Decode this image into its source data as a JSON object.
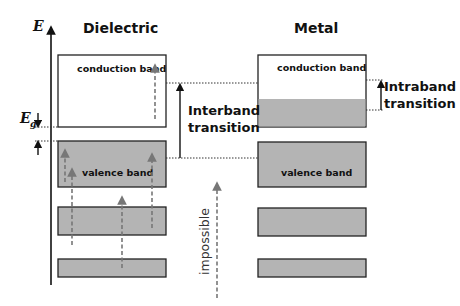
{
  "axis": {
    "label": "E",
    "gap_label": "E",
    "gap_subscript": "g"
  },
  "dielectric": {
    "title": "Dielectric",
    "conduction_band": "conduction band",
    "valence_band": "valence band"
  },
  "metal": {
    "title": "Metal",
    "conduction_band": "conduction band",
    "valence_band": "valence band"
  },
  "transitions": {
    "interband_line1": "Interband",
    "interband_line2": "transition",
    "intraband_line1": "Intraband",
    "intraband_line2": "transition",
    "impossible": "impossible"
  },
  "colors": {
    "band_fill": "#b4b4b4",
    "band_stroke": "#222222",
    "dashed_arrow": "#777777"
  }
}
